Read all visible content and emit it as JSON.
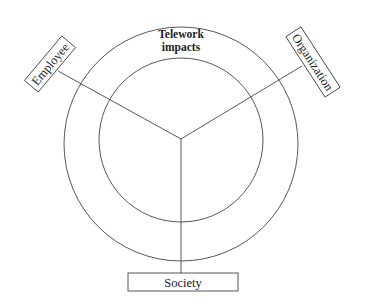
{
  "diagram": {
    "title_line1": "Telework",
    "title_line2": "impacts",
    "nodes": [
      {
        "id": "employee",
        "label": "Employee"
      },
      {
        "id": "organization",
        "label": "Organization"
      },
      {
        "id": "society",
        "label": "Society"
      }
    ],
    "colors": {
      "stroke": "#333333",
      "text": "#222222",
      "background": "#ffffff"
    }
  }
}
